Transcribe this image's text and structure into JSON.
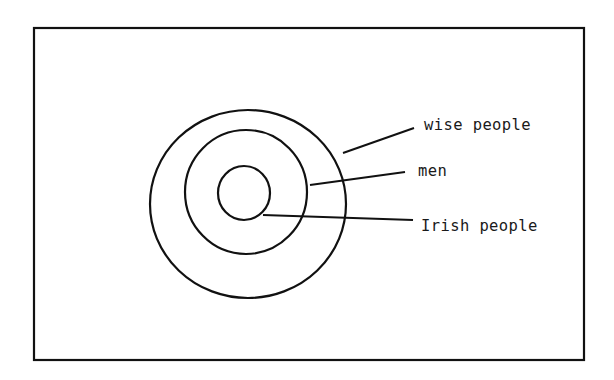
{
  "diagram": {
    "type": "nested-sets",
    "stroke_color": "#111111",
    "background_color": "#ffffff",
    "frame": {
      "x": 34,
      "y": 28,
      "width": 550,
      "height": 332
    },
    "sets": [
      {
        "id": "outer",
        "label": "wise people",
        "ellipse": {
          "cx": 248,
          "cy": 204,
          "rx": 98,
          "ry": 94
        },
        "leader": {
          "x1": 343,
          "y1": 153,
          "x2": 414,
          "y2": 128
        },
        "label_pos": {
          "x": 424,
          "y": 118
        }
      },
      {
        "id": "middle",
        "label": "men",
        "ellipse": {
          "cx": 246,
          "cy": 192,
          "rx": 61,
          "ry": 62
        },
        "leader": {
          "x1": 310,
          "y1": 185,
          "x2": 405,
          "y2": 172
        },
        "label_pos": {
          "x": 418,
          "y": 164
        }
      },
      {
        "id": "inner",
        "label": "Irish people",
        "ellipse": {
          "cx": 244,
          "cy": 193,
          "rx": 26,
          "ry": 27
        },
        "leader": {
          "x1": 263,
          "y1": 215,
          "x2": 413,
          "y2": 220
        },
        "label_pos": {
          "x": 421,
          "y": 219
        }
      }
    ]
  }
}
